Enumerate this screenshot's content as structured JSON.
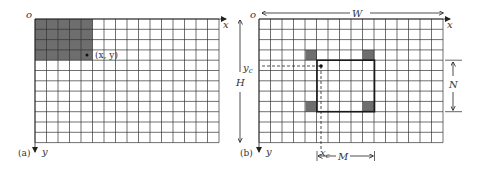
{
  "panels": [
    {
      "id": "a",
      "caption": "(a)",
      "origin_label": "o",
      "x_axis_label": "x",
      "y_axis_label": "y",
      "grid": {
        "cols": 16,
        "rows": 12
      },
      "shaded_block": {
        "cols": 5,
        "rows": 4
      },
      "point_label": "(x, y)"
    },
    {
      "id": "b",
      "caption": "(b)",
      "origin_label": "o",
      "x_axis_label": "x",
      "y_axis_label": "y",
      "grid": {
        "cols": 16,
        "rows": 12
      },
      "width_label": "W",
      "height_label": "H",
      "window_width_label": "M",
      "window_height_label": "N",
      "center_x_label": "x",
      "center_x_sub": "c",
      "center_y_label": "y",
      "center_y_sub": "c"
    }
  ],
  "colors": {
    "grid": "#333333",
    "shade": "#6e6e6e",
    "window": "#1a1a1a"
  }
}
